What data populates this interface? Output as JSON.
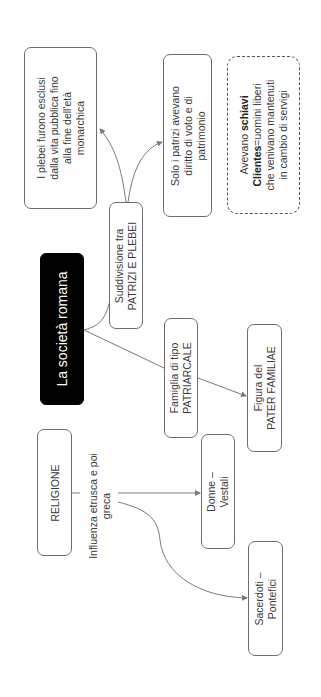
{
  "diagram": {
    "title": "La società romana",
    "nodes": {
      "suddivisione": {
        "line1": "Suddivisione tra",
        "line2": "PATRIZI E PLEBEI"
      },
      "plebei": {
        "lines": [
          "I plebei furono esclusi",
          "dalla vita pubblica fino",
          "alla fine dell'età",
          "monarchica"
        ]
      },
      "patrizi": {
        "lines": [
          "Solo i patrizi avevano",
          "diritto di voto e di",
          "patrimonio"
        ]
      },
      "schiavi": {
        "line1_prefix": "Avevano ",
        "line1_bold": "schiavi",
        "line2_bold": "Clientes",
        "line2_rest": "=uomini liberi",
        "line3": "che venivano mantenuti",
        "line4": "in cambio di servigi"
      },
      "famiglia": {
        "line1": "Famiglia di tipo",
        "line2": "PATRIARCALE"
      },
      "pater": {
        "line1": "Figura del",
        "line2": "PATER FAMILIAE"
      },
      "religione": {
        "label": "RELIGIONE"
      },
      "influenza": {
        "line1": "Influenza etrusca e poi",
        "line2": "greca"
      },
      "vestali": {
        "line1": "Donne –",
        "line2": "Vestali"
      },
      "pontefici": {
        "line1": "Sacerdoti –",
        "line2": "Pontefici"
      }
    },
    "colors": {
      "line": "#7a7a7a",
      "title_bg": "#000000",
      "title_text": "#ffffff"
    }
  }
}
